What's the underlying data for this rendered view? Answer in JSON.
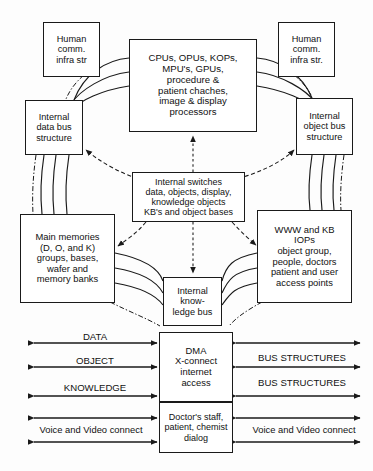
{
  "diagram": {
    "colors": {
      "line": "#1a1a1a",
      "background": "#fdfdfd",
      "box_fill": "#ffffff"
    },
    "boxes": {
      "human_left": {
        "label": "Human\ncomm.\ninfra str"
      },
      "human_right": {
        "label": "Human\ncomm.\ninfra str."
      },
      "cpu_core": {
        "label": "CPUs, OPUs, KOPs,\nMPU's, GPUs,\nprocedure &\npatient chaches,\nimage & display\nprocessors"
      },
      "data_bus": {
        "label": "Internal\ndata bus\nstructure"
      },
      "object_bus": {
        "label": "Internal\nobject bus\nstructure"
      },
      "switches": {
        "label": "Internal switches\ndata, objects, display,\nknowledge objects\nKB's and object bases"
      },
      "main_memories": {
        "label": "Main memories\n(D, O, and K)\ngroups, bases,\nwafer and\nmemory banks"
      },
      "www_kb": {
        "label": "WWW and KB\nIOPs\nobject group,\npeople, doctors\npatient and user\naccess points"
      },
      "knowledge_bus": {
        "label": "Internal\nknow-\nledge bus"
      },
      "dma": {
        "label": "DMA\nX-connect\ninternet\naccess"
      },
      "doctor_dialog": {
        "label": "Doctor's staff,\npatient, chemist\ndialog"
      }
    },
    "io_labels": {
      "left": [
        {
          "text": "DATA"
        },
        {
          "text": "OBJECT"
        },
        {
          "text": "KNOWLEDGE"
        },
        {
          "text": "Voice and Video connect"
        }
      ],
      "right": [
        {
          "text": "BUS STRUCTURES"
        },
        {
          "text": "BUS STRUCTURES"
        },
        {
          "text": "Voice and Video connect"
        }
      ]
    }
  }
}
